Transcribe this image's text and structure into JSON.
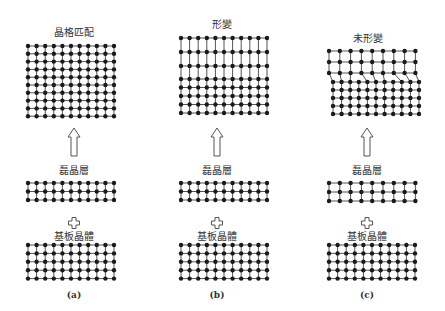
{
  "panels": [
    {
      "id": "a",
      "top_label": "晶格匹配",
      "epi_label": "磊晶層",
      "substrate_label": "基板晶體",
      "caption": "(a)",
      "result": "lattice-matched"
    },
    {
      "id": "b",
      "top_label": "形變",
      "epi_label": "磊晶層",
      "substrate_label": "基板晶體",
      "caption": "(b)",
      "result": "strained"
    },
    {
      "id": "c",
      "top_label": "未形變",
      "epi_label": "磊晶層",
      "substrate_label": "基板晶體",
      "caption": "(c)",
      "result": "relaxed-with-dislocations"
    }
  ],
  "colors": {
    "atom": "#1a1a1a",
    "bond": "#555555",
    "arrow_stroke": "#555555",
    "background": "#ffffff"
  },
  "icons": {
    "up_arrow": "hollow-up-arrow-icon",
    "plus": "hollow-plus-icon"
  }
}
